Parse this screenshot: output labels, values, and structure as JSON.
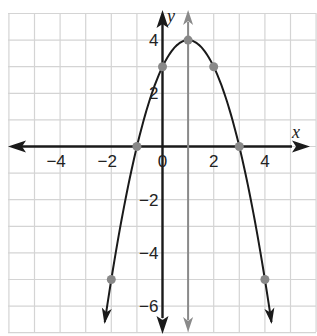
{
  "chart_data": {
    "type": "line",
    "title": "",
    "function": "y = -(x - 1)^2 + 4",
    "xlabel": "x",
    "ylabel": "y",
    "xlim": [
      -6,
      6
    ],
    "ylim": [
      -7,
      5
    ],
    "grid": true,
    "x_ticks": [
      -4,
      -2,
      0,
      2,
      4
    ],
    "y_ticks": [
      4,
      2,
      -2,
      -4,
      -6
    ],
    "x_tick_labels": [
      "−4",
      "−2",
      "0",
      "2",
      "4"
    ],
    "y_tick_labels": [
      "4",
      "2",
      "−2",
      "−4",
      "−6"
    ],
    "points": [
      {
        "x": -2,
        "y": -5
      },
      {
        "x": -1,
        "y": 0
      },
      {
        "x": 0,
        "y": 3
      },
      {
        "x": 1,
        "y": 4
      },
      {
        "x": 2,
        "y": 3
      },
      {
        "x": 3,
        "y": 0
      },
      {
        "x": 4,
        "y": -5
      }
    ],
    "axis_of_symmetry": {
      "x": 1
    },
    "vertex": {
      "x": 1,
      "y": 4
    },
    "colors": {
      "curve": "#1a1a1a",
      "axes": "#1a1a1a",
      "symmetry_line": "#8a8a8a",
      "points": "#888888",
      "grid": "#d4d4d4"
    }
  },
  "labels": {
    "x_axis": "x",
    "y_axis": "y",
    "origin": "0"
  }
}
